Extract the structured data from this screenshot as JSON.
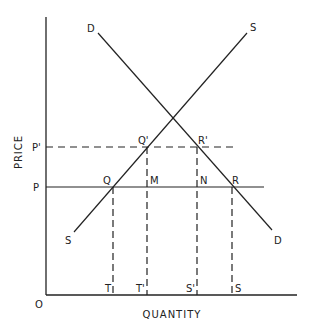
{
  "diagram": {
    "type": "supply-demand",
    "axes": {
      "y_label": "PRICE",
      "x_label": "QUANTITY",
      "origin_label": "O"
    },
    "curves": {
      "demand": {
        "label_top": "D",
        "label_bottom": "D"
      },
      "supply": {
        "label_top": "S",
        "label_bottom": "S"
      }
    },
    "price_levels": [
      {
        "label": "P'",
        "style": "dashed"
      },
      {
        "label": "P",
        "style": "solid"
      }
    ],
    "points": {
      "Q": "Q",
      "Q_prime": "Q'",
      "R_prime": "R'",
      "R": "R",
      "M": "M",
      "N": "N"
    },
    "quantity_marks": [
      "T",
      "T'",
      "S'",
      "S"
    ]
  }
}
